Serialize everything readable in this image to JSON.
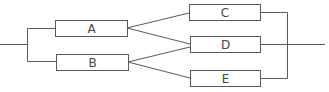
{
  "diagram": {
    "type": "reliability-block-diagram",
    "line_color": "#5a5a5a",
    "box_fill": "#ffffff",
    "nodes": [
      {
        "id": "A",
        "label": "A"
      },
      {
        "id": "B",
        "label": "B"
      },
      {
        "id": "C",
        "label": "C"
      },
      {
        "id": "D",
        "label": "D"
      },
      {
        "id": "E",
        "label": "E"
      }
    ],
    "edges": [
      {
        "from": "input",
        "to": "A"
      },
      {
        "from": "input",
        "to": "B"
      },
      {
        "from": "A",
        "to": "C"
      },
      {
        "from": "A",
        "to": "D"
      },
      {
        "from": "B",
        "to": "D"
      },
      {
        "from": "B",
        "to": "E"
      },
      {
        "from": "C",
        "to": "output"
      },
      {
        "from": "D",
        "to": "output"
      },
      {
        "from": "E",
        "to": "output"
      }
    ]
  }
}
